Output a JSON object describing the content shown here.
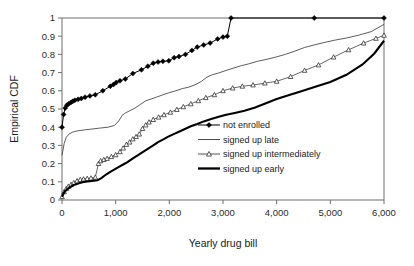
{
  "chart_data": {
    "type": "line",
    "title": "",
    "xlabel": "Yearly drug bill",
    "ylabel": "Empirical CDF",
    "xlim": [
      0,
      6000
    ],
    "ylim": [
      0,
      1
    ],
    "xticks": [
      0,
      1000,
      2000,
      3000,
      4000,
      5000,
      6000
    ],
    "xticklabels": [
      "0",
      "1,000",
      "2,000",
      "3,000",
      "4,000",
      "5,000",
      "6,000"
    ],
    "yticks": [
      0,
      0.1,
      0.2,
      0.3,
      0.4,
      0.5,
      0.6,
      0.7,
      0.8,
      0.9,
      1
    ],
    "yticklabels": [
      "0",
      "0.1",
      "0.2",
      "0.3",
      "0.4",
      "0.5",
      "0.6",
      "0.7",
      "0.8",
      "0.9",
      "1"
    ],
    "grid": false,
    "legend_position": "center-right",
    "series": [
      {
        "name": "not enrolled",
        "marker": "filled-diamond",
        "linewidth": 1,
        "color": "#000000",
        "points": [
          [
            0,
            0.4
          ],
          [
            30,
            0.47
          ],
          [
            60,
            0.505
          ],
          [
            90,
            0.52
          ],
          [
            120,
            0.528
          ],
          [
            160,
            0.535
          ],
          [
            200,
            0.542
          ],
          [
            240,
            0.548
          ],
          [
            300,
            0.553
          ],
          [
            360,
            0.558
          ],
          [
            430,
            0.565
          ],
          [
            520,
            0.572
          ],
          [
            620,
            0.578
          ],
          [
            760,
            0.6
          ],
          [
            900,
            0.625
          ],
          [
            960,
            0.635
          ],
          [
            1010,
            0.645
          ],
          [
            1080,
            0.655
          ],
          [
            1180,
            0.665
          ],
          [
            1320,
            0.695
          ],
          [
            1480,
            0.715
          ],
          [
            1600,
            0.735
          ],
          [
            1700,
            0.752
          ],
          [
            1790,
            0.758
          ],
          [
            1880,
            0.762
          ],
          [
            1990,
            0.765
          ],
          [
            2090,
            0.782
          ],
          [
            2180,
            0.788
          ],
          [
            2300,
            0.8
          ],
          [
            2420,
            0.822
          ],
          [
            2520,
            0.84
          ],
          [
            2640,
            0.852
          ],
          [
            2760,
            0.862
          ],
          [
            2900,
            0.885
          ],
          [
            3000,
            0.895
          ],
          [
            3080,
            0.9
          ],
          [
            3150,
            1.0
          ],
          [
            4700,
            1.0
          ],
          [
            6000,
            1.0
          ]
        ]
      },
      {
        "name": "signed up late",
        "marker": "none",
        "linewidth": 0.9,
        "color": "#4a4a4a",
        "points": [
          [
            0,
            0.245
          ],
          [
            40,
            0.31
          ],
          [
            80,
            0.345
          ],
          [
            130,
            0.362
          ],
          [
            190,
            0.372
          ],
          [
            260,
            0.378
          ],
          [
            340,
            0.382
          ],
          [
            440,
            0.386
          ],
          [
            560,
            0.39
          ],
          [
            700,
            0.395
          ],
          [
            860,
            0.4
          ],
          [
            980,
            0.41
          ],
          [
            1060,
            0.435
          ],
          [
            1120,
            0.465
          ],
          [
            1180,
            0.478
          ],
          [
            1260,
            0.49
          ],
          [
            1360,
            0.505
          ],
          [
            1460,
            0.525
          ],
          [
            1560,
            0.545
          ],
          [
            1660,
            0.555
          ],
          [
            1760,
            0.565
          ],
          [
            1880,
            0.578
          ],
          [
            2000,
            0.59
          ],
          [
            2120,
            0.6
          ],
          [
            2240,
            0.612
          ],
          [
            2360,
            0.62
          ],
          [
            2480,
            0.633
          ],
          [
            2600,
            0.652
          ],
          [
            2700,
            0.675
          ],
          [
            2800,
            0.688
          ],
          [
            2920,
            0.698
          ],
          [
            3060,
            0.712
          ],
          [
            3200,
            0.725
          ],
          [
            3340,
            0.738
          ],
          [
            3480,
            0.748
          ],
          [
            3640,
            0.762
          ],
          [
            3800,
            0.772
          ],
          [
            3980,
            0.785
          ],
          [
            4160,
            0.8
          ],
          [
            4340,
            0.818
          ],
          [
            4520,
            0.838
          ],
          [
            4700,
            0.852
          ],
          [
            4880,
            0.865
          ],
          [
            5080,
            0.878
          ],
          [
            5300,
            0.89
          ],
          [
            5520,
            0.905
          ],
          [
            5760,
            0.925
          ],
          [
            6000,
            0.965
          ]
        ]
      },
      {
        "name": "signed up intermediately",
        "marker": "open-triangle",
        "linewidth": 0.9,
        "color": "#555555",
        "points": [
          [
            0,
            0.018
          ],
          [
            40,
            0.045
          ],
          [
            80,
            0.062
          ],
          [
            120,
            0.075
          ],
          [
            170,
            0.085
          ],
          [
            220,
            0.095
          ],
          [
            280,
            0.105
          ],
          [
            340,
            0.112
          ],
          [
            400,
            0.115
          ],
          [
            470,
            0.118
          ],
          [
            540,
            0.12
          ],
          [
            620,
            0.125
          ],
          [
            680,
            0.2
          ],
          [
            720,
            0.215
          ],
          [
            780,
            0.222
          ],
          [
            840,
            0.228
          ],
          [
            920,
            0.238
          ],
          [
            1000,
            0.248
          ],
          [
            1080,
            0.265
          ],
          [
            1140,
            0.285
          ],
          [
            1200,
            0.305
          ],
          [
            1260,
            0.318
          ],
          [
            1320,
            0.335
          ],
          [
            1380,
            0.348
          ],
          [
            1440,
            0.362
          ],
          [
            1500,
            0.392
          ],
          [
            1560,
            0.412
          ],
          [
            1620,
            0.428
          ],
          [
            1700,
            0.442
          ],
          [
            1800,
            0.455
          ],
          [
            1900,
            0.468
          ],
          [
            2020,
            0.482
          ],
          [
            2140,
            0.497
          ],
          [
            2260,
            0.512
          ],
          [
            2400,
            0.528
          ],
          [
            2540,
            0.545
          ],
          [
            2680,
            0.562
          ],
          [
            2840,
            0.578
          ],
          [
            3000,
            0.6
          ],
          [
            3180,
            0.615
          ],
          [
            3360,
            0.625
          ],
          [
            3560,
            0.632
          ],
          [
            3780,
            0.642
          ],
          [
            4000,
            0.652
          ],
          [
            4260,
            0.678
          ],
          [
            4520,
            0.712
          ],
          [
            4780,
            0.742
          ],
          [
            5060,
            0.785
          ],
          [
            5340,
            0.825
          ],
          [
            5620,
            0.862
          ],
          [
            5850,
            0.888
          ],
          [
            6000,
            0.905
          ]
        ]
      },
      {
        "name": "signed up early",
        "marker": "none",
        "linewidth": 2.1,
        "color": "#000000",
        "points": [
          [
            0,
            0.018
          ],
          [
            40,
            0.042
          ],
          [
            90,
            0.058
          ],
          [
            150,
            0.07
          ],
          [
            220,
            0.082
          ],
          [
            300,
            0.09
          ],
          [
            380,
            0.098
          ],
          [
            470,
            0.102
          ],
          [
            560,
            0.105
          ],
          [
            660,
            0.108
          ],
          [
            740,
            0.122
          ],
          [
            820,
            0.14
          ],
          [
            900,
            0.155
          ],
          [
            980,
            0.168
          ],
          [
            1060,
            0.182
          ],
          [
            1140,
            0.195
          ],
          [
            1220,
            0.208
          ],
          [
            1300,
            0.225
          ],
          [
            1380,
            0.24
          ],
          [
            1460,
            0.255
          ],
          [
            1540,
            0.27
          ],
          [
            1620,
            0.285
          ],
          [
            1700,
            0.3
          ],
          [
            1790,
            0.318
          ],
          [
            1880,
            0.332
          ],
          [
            1980,
            0.348
          ],
          [
            2080,
            0.362
          ],
          [
            2180,
            0.375
          ],
          [
            2290,
            0.39
          ],
          [
            2400,
            0.405
          ],
          [
            2520,
            0.418
          ],
          [
            2640,
            0.432
          ],
          [
            2780,
            0.445
          ],
          [
            2920,
            0.458
          ],
          [
            3060,
            0.468
          ],
          [
            3220,
            0.478
          ],
          [
            3400,
            0.49
          ],
          [
            3600,
            0.508
          ],
          [
            3800,
            0.532
          ],
          [
            4000,
            0.555
          ],
          [
            4220,
            0.575
          ],
          [
            4460,
            0.598
          ],
          [
            4720,
            0.622
          ],
          [
            5000,
            0.648
          ],
          [
            5300,
            0.688
          ],
          [
            5600,
            0.745
          ],
          [
            5820,
            0.805
          ],
          [
            6000,
            0.875
          ]
        ]
      }
    ]
  },
  "legend": {
    "items": [
      {
        "label": "not enrolled",
        "swatch": "line-with-filled-diamond"
      },
      {
        "label": "signed up late",
        "swatch": "thin-line"
      },
      {
        "label": "signed up intermediately",
        "swatch": "line-with-open-triangle"
      },
      {
        "label": "signed up early",
        "swatch": "thick-line"
      }
    ]
  },
  "colors": {
    "axis": "#6e6e6e",
    "text": "#1a1a1a",
    "background": "#ffffff",
    "series_dark": "#000000",
    "series_gray": "#4a4a4a"
  }
}
